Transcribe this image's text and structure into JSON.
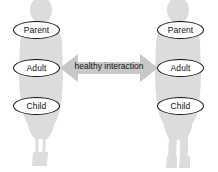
{
  "diagram": {
    "background_color": "#ffffff",
    "figure_color": "#dcdcdc",
    "ellipse_stroke_color": "#111111",
    "ellipse_fill_color": "#ffffff",
    "arrow_color": "#c8c8c8",
    "caption": "healthy interaction",
    "persons": [
      {
        "side": "left",
        "ego_states": [
          {
            "label": "Parent"
          },
          {
            "label": "Adult"
          },
          {
            "label": "Child"
          }
        ]
      },
      {
        "side": "right",
        "ego_states": [
          {
            "label": "Parent"
          },
          {
            "label": "Adult"
          },
          {
            "label": "Child"
          }
        ]
      }
    ],
    "arrow": {
      "type": "double-headed",
      "from": "left-adult",
      "to": "right-adult",
      "label": "healthy interaction"
    }
  }
}
